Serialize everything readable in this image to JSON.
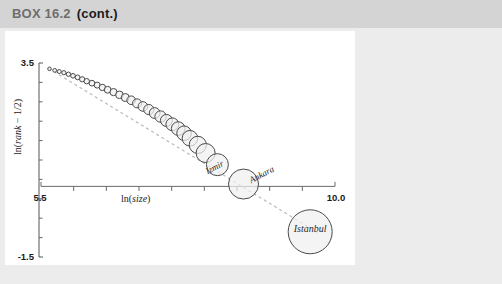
{
  "header": {
    "box_label": "BOX 16.2",
    "cont_label": "(cont.)",
    "bg_color": "#d4d4d4"
  },
  "page": {
    "bg_color": "#ececec",
    "panel_bg": "#ffffff"
  },
  "chart_data": {
    "type": "scatter",
    "title": "",
    "xlabel": "ln(size)",
    "ylabel": "ln(rank − 1/2)",
    "xlim": [
      5.5,
      10.0
    ],
    "ylim": [
      -1.5,
      3.5
    ],
    "x_tick_labels": [
      "5.5",
      "10.0"
    ],
    "y_tick_labels": [
      "3.5",
      "-1.5"
    ],
    "x_ticks": [
      5.5,
      6.0,
      6.5,
      7.0,
      7.5,
      8.0,
      8.5,
      9.0,
      9.5,
      10.0
    ],
    "y_ticks": [
      -1.5,
      -1.0,
      -0.5,
      0.0,
      0.5,
      1.0,
      1.5,
      2.0,
      2.5,
      3.0,
      3.5
    ],
    "grid": false,
    "legend": null,
    "marker_style": "open-circle-size-proportional",
    "trend_line": {
      "style": "dashed",
      "color": "#b9b9b9",
      "x0": 5.62,
      "y0": 3.36,
      "x1": 9.78,
      "y1": -0.92
    },
    "annotations": [
      {
        "text": "Izmir",
        "x": 8.05,
        "y": 0.63,
        "rotation": -28
      },
      {
        "text": "Ankara",
        "x": 8.72,
        "y": 0.4,
        "rotation": -28
      },
      {
        "text": "Istanbul",
        "x": 9.62,
        "y": -0.85,
        "rotation": 0
      }
    ],
    "points": [
      {
        "x": 5.63,
        "y": 3.35,
        "r": 1.8
      },
      {
        "x": 5.71,
        "y": 3.31,
        "r": 1.9
      },
      {
        "x": 5.78,
        "y": 3.28,
        "r": 2.0
      },
      {
        "x": 5.85,
        "y": 3.25,
        "r": 2.1
      },
      {
        "x": 5.92,
        "y": 3.21,
        "r": 2.2
      },
      {
        "x": 5.99,
        "y": 3.17,
        "r": 2.3
      },
      {
        "x": 6.06,
        "y": 3.13,
        "r": 2.4
      },
      {
        "x": 6.13,
        "y": 3.08,
        "r": 2.6
      },
      {
        "x": 6.2,
        "y": 3.03,
        "r": 2.7
      },
      {
        "x": 6.28,
        "y": 2.98,
        "r": 2.9
      },
      {
        "x": 6.36,
        "y": 2.93,
        "r": 3.0
      },
      {
        "x": 6.44,
        "y": 2.87,
        "r": 3.2
      },
      {
        "x": 6.52,
        "y": 2.81,
        "r": 3.4
      },
      {
        "x": 6.61,
        "y": 2.75,
        "r": 3.6
      },
      {
        "x": 6.7,
        "y": 2.68,
        "r": 3.8
      },
      {
        "x": 6.79,
        "y": 2.61,
        "r": 4.0
      },
      {
        "x": 6.88,
        "y": 2.54,
        "r": 4.3
      },
      {
        "x": 6.97,
        "y": 2.46,
        "r": 4.5
      },
      {
        "x": 7.06,
        "y": 2.38,
        "r": 4.8
      },
      {
        "x": 7.15,
        "y": 2.3,
        "r": 5.1
      },
      {
        "x": 7.24,
        "y": 2.21,
        "r": 5.4
      },
      {
        "x": 7.33,
        "y": 2.12,
        "r": 5.7
      },
      {
        "x": 7.42,
        "y": 2.02,
        "r": 6.0
      },
      {
        "x": 7.51,
        "y": 1.92,
        "r": 6.4
      },
      {
        "x": 7.6,
        "y": 1.81,
        "r": 6.8
      },
      {
        "x": 7.69,
        "y": 1.69,
        "r": 7.3
      },
      {
        "x": 7.78,
        "y": 1.56,
        "r": 7.8
      },
      {
        "x": 7.9,
        "y": 1.39,
        "r": 8.6
      },
      {
        "x": 8.02,
        "y": 1.18,
        "r": 9.5
      },
      {
        "x": 8.2,
        "y": 0.88,
        "r": 11.0
      },
      {
        "x": 8.6,
        "y": 0.38,
        "r": 15.0
      },
      {
        "x": 9.62,
        "y": -0.85,
        "r": 22.0
      }
    ]
  }
}
